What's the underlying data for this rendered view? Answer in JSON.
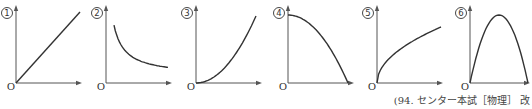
{
  "figure": {
    "origin_label": "O",
    "graphs": [
      {
        "number": "1",
        "shape": "linear-increasing"
      },
      {
        "number": "2",
        "shape": "inverse-decreasing"
      },
      {
        "number": "3",
        "shape": "quadratic-increasing"
      },
      {
        "number": "4",
        "shape": "downward-parabola-from-max"
      },
      {
        "number": "5",
        "shape": "square-root-increasing"
      },
      {
        "number": "6",
        "shape": "downward-parabola-arch"
      }
    ],
    "source": "(94. センター本試［物理］ 改"
  }
}
